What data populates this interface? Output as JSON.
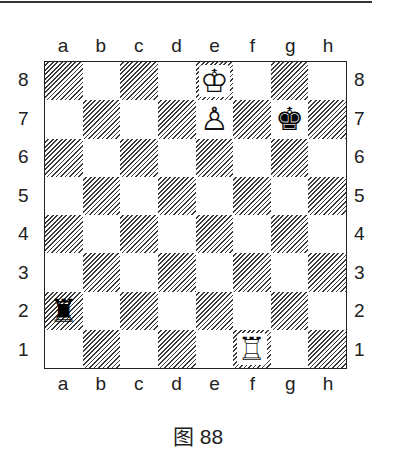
{
  "figure": {
    "caption": "图 88",
    "files": [
      "a",
      "b",
      "c",
      "d",
      "e",
      "f",
      "g",
      "h"
    ],
    "ranks": [
      "8",
      "7",
      "6",
      "5",
      "4",
      "3",
      "2",
      "1"
    ],
    "square_style": {
      "light": "#ffffff",
      "dark": "diagonal-hatch",
      "hatch_color": "#3a3a3a"
    },
    "pieces": [
      {
        "square": "e8",
        "color": "white",
        "type": "king",
        "glyph": "♔"
      },
      {
        "square": "e7",
        "color": "white",
        "type": "pawn",
        "glyph": "♙"
      },
      {
        "square": "g7",
        "color": "black",
        "type": "king",
        "glyph": "♚"
      },
      {
        "square": "a2",
        "color": "black",
        "type": "rook",
        "glyph": "♜"
      },
      {
        "square": "f1",
        "color": "white",
        "type": "rook",
        "glyph": "♖"
      }
    ]
  }
}
